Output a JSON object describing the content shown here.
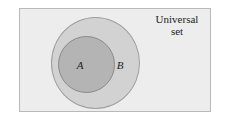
{
  "figure": {
    "type": "venn-diagram",
    "caption_line1": "Universal",
    "caption_line2": "set",
    "universal_set": {
      "name": "universal-set",
      "shape": "rectangle",
      "fill_color": "#ededed",
      "border_color": "#b9b9b9"
    },
    "sets": [
      {
        "label": "B",
        "shape": "circle",
        "fill_color": "#d2d2d2",
        "border_color": "#9e9e9e",
        "contains": "A"
      },
      {
        "label": "A",
        "shape": "circle",
        "fill_color": "#b4b4b4",
        "border_color": "#8a8a8a",
        "contains": null
      }
    ]
  }
}
